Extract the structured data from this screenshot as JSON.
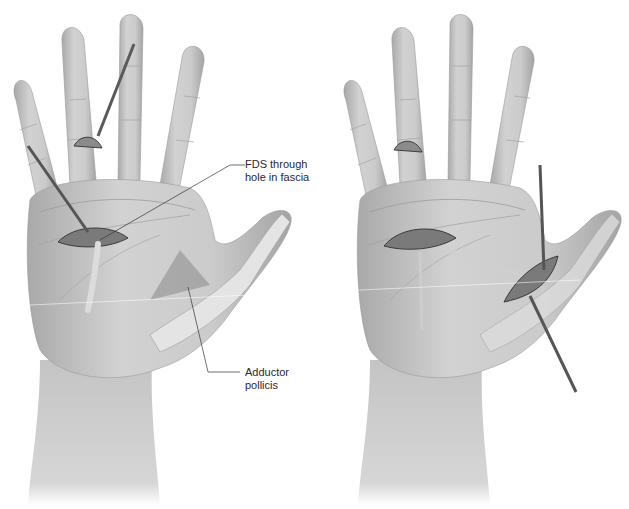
{
  "figure": {
    "panels": [
      {
        "id": "left",
        "description": "Palm view: FDS tendon harvested from ring finger and routed through hole in palmar fascia toward adductor pollicis",
        "callouts": [
          {
            "line1": "FDS through",
            "line2": "hole in fascia"
          },
          {
            "line1": "Adductor",
            "line2": "pollicis"
          }
        ]
      },
      {
        "id": "right",
        "description": "Palm view: tendon passed subcutaneously from palmar incision to thumb incision",
        "callouts": []
      }
    ]
  },
  "colors": {
    "background": "#ffffff",
    "skin": "#c9c9c9",
    "skin_shadow": "#9a9a9a",
    "incision": "#6e6e6e",
    "instrument": "#555555",
    "bone": "#e6e6e6",
    "leader_line": "#333333"
  }
}
